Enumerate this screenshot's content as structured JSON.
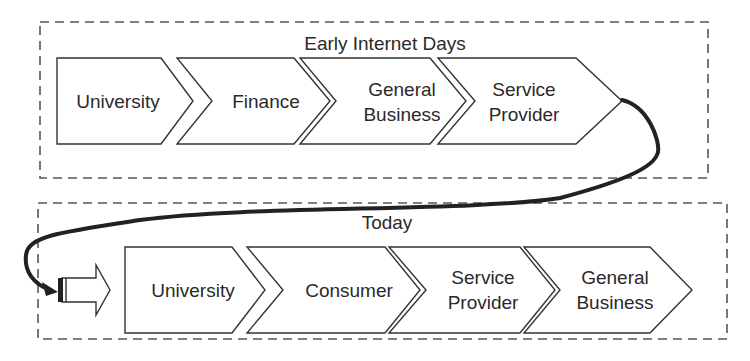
{
  "groups": [
    {
      "title": "Early Internet Days",
      "steps": [
        {
          "line1": "University",
          "line2": ""
        },
        {
          "line1": "Finance",
          "line2": ""
        },
        {
          "line1": "General",
          "line2": "Business"
        },
        {
          "line1": "Service",
          "line2": "Provider"
        }
      ]
    },
    {
      "title": "Today",
      "steps": [
        {
          "line1": "University",
          "line2": ""
        },
        {
          "line1": "Consumer",
          "line2": ""
        },
        {
          "line1": "Service",
          "line2": "Provider"
        },
        {
          "line1": "General",
          "line2": "Business"
        }
      ]
    }
  ],
  "colors": {
    "stroke": "#333333",
    "dash": "#555555",
    "connector": "#222222"
  }
}
